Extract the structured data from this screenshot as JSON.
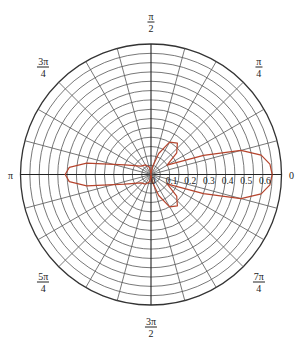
{
  "chart_data": {
    "type": "polar-line",
    "title": "",
    "angle_labels": [
      {
        "angle_deg": 0,
        "num": "0",
        "den": ""
      },
      {
        "angle_deg": 45,
        "num": "π",
        "den": "4"
      },
      {
        "angle_deg": 90,
        "num": "π",
        "den": "2"
      },
      {
        "angle_deg": 135,
        "num": "3π",
        "den": "4"
      },
      {
        "angle_deg": 180,
        "num": "π",
        "den": ""
      },
      {
        "angle_deg": 225,
        "num": "5π",
        "den": "4"
      },
      {
        "angle_deg": 270,
        "num": "3π",
        "den": "2"
      },
      {
        "angle_deg": 315,
        "num": "7π",
        "den": "4"
      }
    ],
    "radial_ticks": [
      "0",
      "0.1",
      "0.2",
      "0.3",
      "0.4",
      "0.5",
      "0.6"
    ],
    "rlim": [
      0,
      0.7
    ],
    "ring_step": 0.05,
    "spoke_step_deg": 15,
    "grid": true,
    "series": [
      {
        "name": "r(θ)",
        "color": "#b5452e",
        "points_theta_deg_r": [
          [
            0,
            0.65
          ],
          [
            5,
            0.64
          ],
          [
            10,
            0.6
          ],
          [
            15,
            0.5
          ],
          [
            20,
            0.3
          ],
          [
            25,
            0.15
          ],
          [
            30,
            0.1
          ],
          [
            40,
            0.18
          ],
          [
            50,
            0.22
          ],
          [
            60,
            0.2
          ],
          [
            70,
            0.12
          ],
          [
            80,
            0.04
          ],
          [
            90,
            0.0
          ],
          [
            100,
            0.04
          ],
          [
            120,
            0.06
          ],
          [
            140,
            0.07
          ],
          [
            160,
            0.15
          ],
          [
            170,
            0.35
          ],
          [
            175,
            0.44
          ],
          [
            180,
            0.46
          ],
          [
            185,
            0.44
          ],
          [
            190,
            0.35
          ],
          [
            200,
            0.15
          ],
          [
            220,
            0.07
          ],
          [
            240,
            0.06
          ],
          [
            260,
            0.04
          ],
          [
            270,
            0.0
          ],
          [
            280,
            0.04
          ],
          [
            290,
            0.12
          ],
          [
            300,
            0.2
          ],
          [
            310,
            0.22
          ],
          [
            320,
            0.18
          ],
          [
            330,
            0.1
          ],
          [
            335,
            0.15
          ],
          [
            340,
            0.3
          ],
          [
            345,
            0.5
          ],
          [
            350,
            0.6
          ],
          [
            355,
            0.64
          ],
          [
            360,
            0.65
          ]
        ]
      }
    ]
  }
}
